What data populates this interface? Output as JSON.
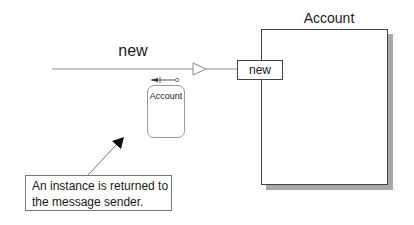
{
  "diagram": {
    "message": {
      "label": "new",
      "line_color": "#888888",
      "arrowhead": "open-triangle"
    },
    "class": {
      "title": "Account",
      "shadow_color": "#a9a9a9",
      "method": {
        "label": "new"
      }
    },
    "return_icon": "return-arrow-icon",
    "instance": {
      "label": "Account"
    },
    "callout": {
      "line1": "An instance is returned to",
      "line2": "the message sender."
    }
  }
}
